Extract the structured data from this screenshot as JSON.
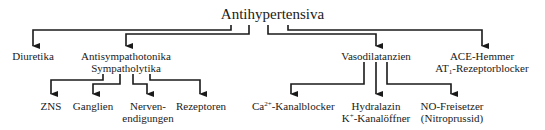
{
  "diagram": {
    "root": {
      "label": "Antihypertensiva"
    },
    "level1": [
      {
        "id": "diuretika",
        "label": "Diuretika"
      },
      {
        "id": "antisympathotonika",
        "line1": "Antisympathotonika",
        "line2": "Sympatholytika"
      },
      {
        "id": "vasodilatanzien",
        "label": "Vasodilatanzien"
      },
      {
        "id": "ace",
        "line1": "ACE-Hemmer",
        "line2_prefix": "AT",
        "line2_sub": "1",
        "line2_suffix": "-Rezeptorblocker"
      }
    ],
    "antisympathotonika_children": [
      {
        "id": "zns",
        "label": "ZNS"
      },
      {
        "id": "ganglien",
        "label": "Ganglien"
      },
      {
        "id": "nervenendigungen",
        "line1": "Nerven-",
        "line2": "endigungen"
      },
      {
        "id": "rezeptoren",
        "label": "Rezeptoren"
      }
    ],
    "vasodilatanzien_children": [
      {
        "id": "ca",
        "prefix": "Ca",
        "sup": "2+",
        "suffix": "-Kanalblocker"
      },
      {
        "id": "hydralazin",
        "line1": "Hydralazin",
        "line2_prefix": "K",
        "line2_sup": "+",
        "line2_suffix": "-Kanalöffner"
      },
      {
        "id": "no",
        "line1": "NO-Freisetzer",
        "line2": "(Nitroprussid)"
      }
    ],
    "colors": {
      "line": "#1a1a1a",
      "text": "#1a1a1a",
      "background": "#ffffff"
    }
  }
}
